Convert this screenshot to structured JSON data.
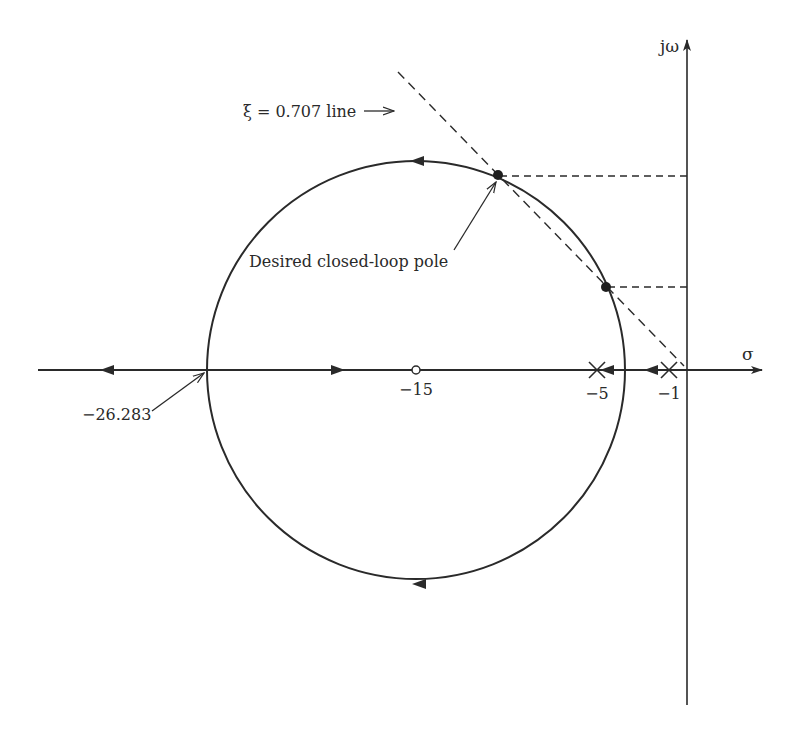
{
  "diagram": {
    "type": "root-locus",
    "axes": {
      "horizontal_label": "σ",
      "vertical_label": "jω",
      "origin_px": [
        687,
        370
      ],
      "scale_px_per_unit": 18.07
    },
    "annotations": {
      "zeta_line_label": "ξ = 0.707 line",
      "desired_pole_label": "Desired closed-loop pole",
      "breakin_label": "−26.283"
    },
    "tick_labels": {
      "zero_label": "−15",
      "pole_a_label": "−5",
      "pole_b_label": "−1"
    },
    "open_loop_poles": [
      -1,
      -5
    ],
    "open_loop_zeros": [
      -15
    ],
    "breakaway_point": -26.283,
    "zeta": 0.707,
    "locus_circle": {
      "center": -15,
      "radius_units": 11.5
    },
    "intersection_points": [
      {
        "name": "desired closed-loop pole",
        "sigma": -10.5,
        "omega": 10.7
      },
      {
        "name": "second intersection",
        "sigma": -4.5,
        "omega": 4.6
      }
    ],
    "colors": {
      "ink": "#2a2a2a",
      "background": "#ffffff"
    }
  }
}
